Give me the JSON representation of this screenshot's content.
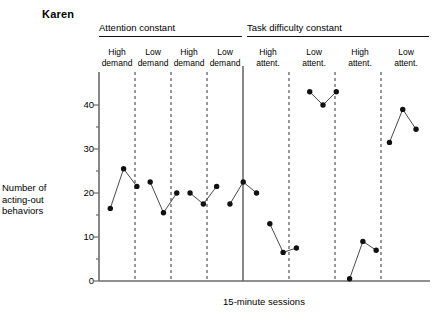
{
  "figure": {
    "subject_title": "Karen",
    "ylabel": "Number of acting-out behaviors",
    "xlabel": "15-minute sessions",
    "condition_headers": [
      {
        "label": "Attention constant"
      },
      {
        "label": "Task difficulty constant"
      }
    ],
    "phase_labels": [
      {
        "line1": "High",
        "line2": "demand"
      },
      {
        "line1": "Low",
        "line2": "demand"
      },
      {
        "line1": "High",
        "line2": "demand"
      },
      {
        "line1": "Low",
        "line2": "demand"
      },
      {
        "line1": "High",
        "line2": "attent."
      },
      {
        "line1": "Low",
        "line2": "attent."
      },
      {
        "line1": "High",
        "line2": "attent."
      },
      {
        "line1": "Low",
        "line2": "attent."
      }
    ],
    "ytick_labels": [
      "0",
      "10",
      "20",
      "30",
      "40"
    ],
    "colors": {
      "axis": "#6b6b6b",
      "marker": "#111111",
      "line": "#333333",
      "phase_divider": "#444444",
      "condition_divider": "#6b6b6b",
      "text": "#000000"
    }
  },
  "chart_data": {
    "type": "line",
    "title": "Karen",
    "xlabel": "15-minute sessions",
    "ylabel": "Number of acting-out behaviors",
    "ylim": [
      0,
      45
    ],
    "yticks": [
      0,
      10,
      20,
      30,
      40
    ],
    "grid": false,
    "legend": false,
    "condition_groups": [
      {
        "name": "Attention constant",
        "phases": [
          "High demand",
          "Low demand",
          "High demand",
          "Low demand"
        ]
      },
      {
        "name": "Task difficulty constant",
        "phases": [
          "High attent.",
          "Low attent.",
          "High attent.",
          "Low attent."
        ]
      }
    ],
    "phases": [
      {
        "name": "High demand",
        "group": "Attention constant",
        "x": [
          1,
          2,
          3
        ],
        "values": [
          16.5,
          25.5,
          21.5
        ]
      },
      {
        "name": "Low demand",
        "group": "Attention constant",
        "x": [
          4,
          5,
          6
        ],
        "values": [
          22.5,
          15.5,
          20.0
        ]
      },
      {
        "name": "High demand",
        "group": "Attention constant",
        "x": [
          7,
          8,
          9
        ],
        "values": [
          20.0,
          17.5,
          21.5
        ]
      },
      {
        "name": "Low demand",
        "group": "Attention constant",
        "x": [
          10,
          11,
          12
        ],
        "values": [
          17.5,
          22.5,
          20.0
        ]
      },
      {
        "name": "High attent.",
        "group": "Task difficulty constant",
        "x": [
          13,
          14,
          15
        ],
        "values": [
          13.0,
          6.5,
          7.5
        ]
      },
      {
        "name": "Low attent.",
        "group": "Task difficulty constant",
        "x": [
          16,
          17,
          18
        ],
        "values": [
          43.0,
          40.0,
          43.0
        ]
      },
      {
        "name": "High attent.",
        "group": "Task difficulty constant",
        "x": [
          19,
          20,
          21
        ],
        "values": [
          0.5,
          9.0,
          7.0
        ]
      },
      {
        "name": "Low attent.",
        "group": "Task difficulty constant",
        "x": [
          22,
          23,
          24
        ],
        "values": [
          31.5,
          39.0,
          34.5
        ]
      }
    ]
  }
}
